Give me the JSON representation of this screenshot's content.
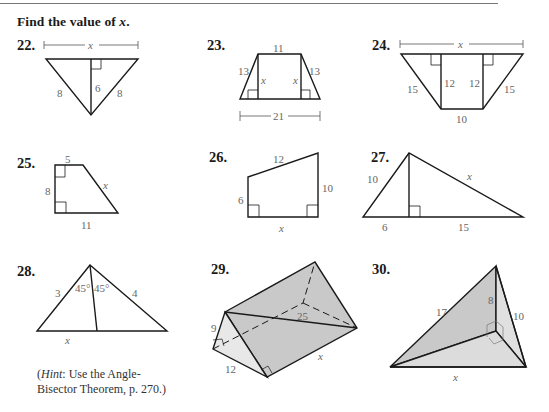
{
  "header": {
    "instruction_prefix": "Find the value of ",
    "instruction_var": "x",
    "instruction_suffix": "."
  },
  "problems": [
    {
      "number": "22.",
      "labels": {
        "top": "x",
        "left": "8",
        "altitude": "6",
        "right": "8"
      }
    },
    {
      "number": "23.",
      "labels": {
        "top": "11",
        "left": "13",
        "right": "13",
        "height_left": "x",
        "height_right": "x",
        "bottom": "21"
      }
    },
    {
      "number": "24.",
      "labels": {
        "top": "x",
        "left": "15",
        "right": "15",
        "height_left": "12",
        "height_right": "12",
        "bottom": "10"
      }
    },
    {
      "number": "25.",
      "labels": {
        "top": "5",
        "left": "8",
        "slant": "x",
        "bottom": "11"
      }
    },
    {
      "number": "26.",
      "labels": {
        "top": "12",
        "left": "6",
        "right": "10",
        "bottom": "x"
      }
    },
    {
      "number": "27.",
      "labels": {
        "left": "10",
        "hyp": "x",
        "bottom_left": "6",
        "bottom_right": "15"
      }
    },
    {
      "number": "28.",
      "labels": {
        "left": "3",
        "angle_left": "45°",
        "angle_right": "45°",
        "right": "4",
        "bottom": "x"
      }
    },
    {
      "number": "29.",
      "labels": {
        "height": "9",
        "base": "12",
        "diagonal": "25",
        "length": "x"
      }
    },
    {
      "number": "30.",
      "labels": {
        "left": "17",
        "height": "8",
        "right": "10",
        "bottom": "x"
      }
    }
  ],
  "hint": {
    "open": "(",
    "word": "Hint",
    "line1_rest": ": Use the Angle-",
    "line2": "Bisector Theorem, p. 270.)"
  },
  "colors": {
    "shade_dark": "#c9c9c9",
    "shade_light": "#e6e6e6",
    "line": "#1a1a1a",
    "label": "#666666"
  }
}
